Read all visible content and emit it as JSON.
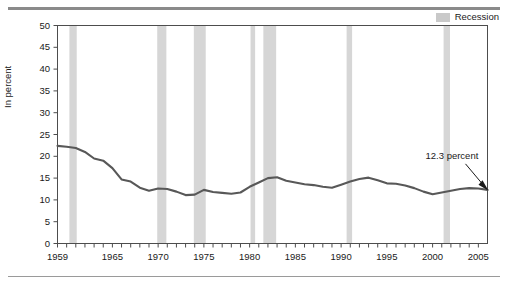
{
  "figure": {
    "legend": {
      "label": "Recession",
      "swatch_color": "#c9c9c9"
    },
    "annotation": {
      "text": "12.3 percent"
    }
  },
  "chart_data": {
    "type": "line",
    "title": "",
    "subtitle": "",
    "xlabel": "",
    "ylabel": "In percent",
    "xlim": [
      1959,
      2006
    ],
    "ylim": [
      0,
      50
    ],
    "grid": false,
    "legend_position": "top-right",
    "line_color": "#585858",
    "recession_band_color": "#d6d6d6",
    "ytick_labels": [
      "0",
      "5",
      "10",
      "15",
      "20",
      "25",
      "30",
      "35",
      "40",
      "45",
      "50"
    ],
    "ytick_values": [
      0,
      5,
      10,
      15,
      20,
      25,
      30,
      35,
      40,
      45,
      50
    ],
    "xtick_labels": [
      "1959",
      "1965",
      "1970",
      "1975",
      "1980",
      "1985",
      "1990",
      "1995",
      "2000",
      "2005"
    ],
    "xtick_values": [
      1959,
      1965,
      1970,
      1975,
      1980,
      1985,
      1990,
      1995,
      2000,
      2005
    ],
    "xtick_minor_step": 1,
    "series": [
      {
        "name": "In percent",
        "x": [
          1959,
          1960,
          1961,
          1962,
          1963,
          1964,
          1965,
          1966,
          1967,
          1968,
          1969,
          1970,
          1971,
          1972,
          1973,
          1974,
          1975,
          1976,
          1977,
          1978,
          1979,
          1980,
          1981,
          1982,
          1983,
          1984,
          1985,
          1986,
          1987,
          1988,
          1989,
          1990,
          1991,
          1992,
          1993,
          1994,
          1995,
          1996,
          1997,
          1998,
          1999,
          2000,
          2001,
          2002,
          2003,
          2004,
          2005,
          2006
        ],
        "values": [
          22.4,
          22.2,
          21.9,
          21.0,
          19.5,
          19.0,
          17.3,
          14.7,
          14.2,
          12.8,
          12.1,
          12.6,
          12.5,
          11.9,
          11.1,
          11.2,
          12.3,
          11.8,
          11.6,
          11.4,
          11.7,
          13.0,
          14.0,
          15.0,
          15.2,
          14.4,
          14.0,
          13.6,
          13.4,
          13.0,
          12.8,
          13.5,
          14.2,
          14.8,
          15.1,
          14.5,
          13.8,
          13.7,
          13.3,
          12.7,
          11.9,
          11.3,
          11.7,
          12.1,
          12.5,
          12.7,
          12.6,
          12.3
        ]
      }
    ],
    "recessions": [
      {
        "start": 1960.3,
        "end": 1961.1
      },
      {
        "start": 1969.9,
        "end": 1970.9
      },
      {
        "start": 1973.9,
        "end": 1975.2
      },
      {
        "start": 1980.1,
        "end": 1980.6
      },
      {
        "start": 1981.5,
        "end": 1982.9
      },
      {
        "start": 1990.6,
        "end": 1991.2
      },
      {
        "start": 2001.2,
        "end": 2001.9
      }
    ],
    "final_value": 12.3
  }
}
